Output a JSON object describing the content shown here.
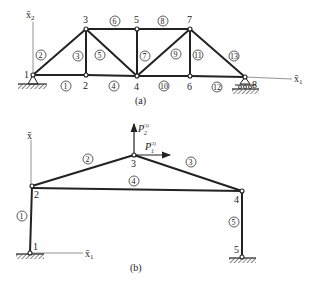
{
  "figure_a": {
    "caption": "(a)",
    "axis_x1_label": "x̄",
    "axis_x1_sub": "1",
    "axis_x2_label": "x̄",
    "axis_x2_sub": "2",
    "nodes": [
      {
        "id": "1",
        "x": 33,
        "y": 75
      },
      {
        "id": "2",
        "x": 86,
        "y": 75
      },
      {
        "id": "3",
        "x": 86,
        "y": 29
      },
      {
        "id": "4",
        "x": 137,
        "y": 76
      },
      {
        "id": "5",
        "x": 137,
        "y": 29
      },
      {
        "id": "6",
        "x": 190,
        "y": 76
      },
      {
        "id": "7",
        "x": 190,
        "y": 29
      },
      {
        "id": "8",
        "x": 245,
        "y": 77
      }
    ],
    "members": [
      "1",
      "2",
      "3",
      "4",
      "5",
      "6",
      "7",
      "8",
      "9",
      "10",
      "11",
      "12",
      "13"
    ]
  },
  "figure_b": {
    "caption": "(b)",
    "axis_x1_label": "x̄",
    "axis_x1_sub": "1",
    "axis_x2_label": "x̄",
    "nodes": [
      {
        "id": "1",
        "x": 30,
        "y": 253
      },
      {
        "id": "2",
        "x": 32,
        "y": 186
      },
      {
        "id": "3",
        "x": 134,
        "y": 155
      },
      {
        "id": "4",
        "x": 242,
        "y": 191
      },
      {
        "id": "5",
        "x": 242,
        "y": 257
      }
    ],
    "members": [
      "1",
      "2",
      "3",
      "4",
      "5"
    ],
    "loads": {
      "p1_label": "P",
      "p1_sub": "1",
      "p1_sup": "(3)",
      "p2_label": "P",
      "p2_sub": "2",
      "p2_sup": "(3)"
    }
  }
}
